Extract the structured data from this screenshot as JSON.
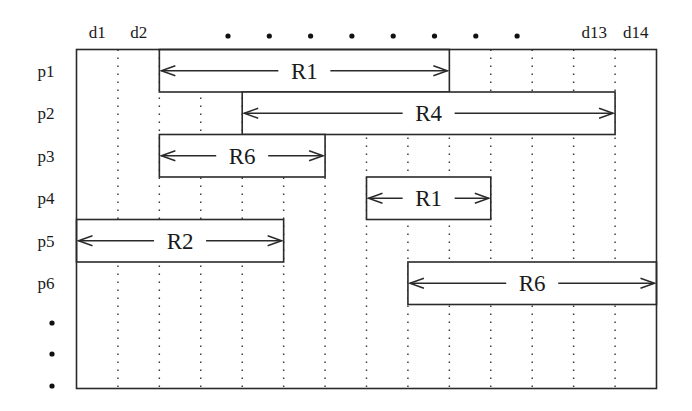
{
  "diagram": {
    "title": "",
    "columns": {
      "count": 14,
      "labels": [
        {
          "text": "d1",
          "col": 1
        },
        {
          "text": "d2",
          "col": 2
        },
        {
          "text": "d13",
          "col": 13
        },
        {
          "text": "d14",
          "col": 14
        }
      ],
      "ellipsis_dots": 8
    },
    "rows": {
      "labels": [
        "p1",
        "p2",
        "p3",
        "p4",
        "p5",
        "p6"
      ],
      "ellipsis_dots": 3
    },
    "bars": [
      {
        "row": "p1",
        "label": "R1",
        "start_col": 3,
        "end_col": 9
      },
      {
        "row": "p2",
        "label": "R4",
        "start_col": 5,
        "end_col": 13
      },
      {
        "row": "p3",
        "label": "R6",
        "start_col": 3,
        "end_col": 6
      },
      {
        "row": "p4",
        "label": "R1",
        "start_col": 8,
        "end_col": 10
      },
      {
        "row": "p5",
        "label": "R2",
        "start_col": 1,
        "end_col": 5
      },
      {
        "row": "p6",
        "label": "R6",
        "start_col": 9,
        "end_col": 14
      }
    ],
    "colors": {
      "line": "#2a2a2a",
      "text": "#1a1a1a",
      "background": "#ffffff"
    }
  }
}
